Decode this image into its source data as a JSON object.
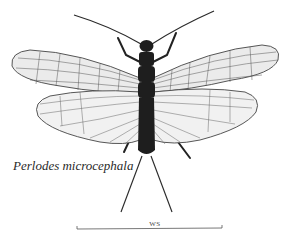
{
  "figure": {
    "species_name": "Perlodes microcephala",
    "scale_bar_label": "WS",
    "colors": {
      "background": "#ffffff",
      "body": "#1e1e1e",
      "wing_fill": "#e9e9e9",
      "wing_veins": "#4a4a4a",
      "label_text": "#2a2a2a"
    }
  }
}
